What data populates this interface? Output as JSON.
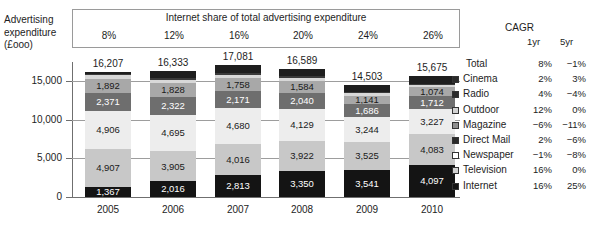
{
  "axis_title": [
    "Advertising",
    "expenditure",
    "(£ooo)"
  ],
  "share_header": {
    "title": "Internet share of total advertising expenditure",
    "values": [
      "8%",
      "12%",
      "16%",
      "20%",
      "24%",
      "26%"
    ]
  },
  "cagr": {
    "title": "CAGR",
    "col1": "1yr",
    "col2": "5yr"
  },
  "legend": [
    {
      "name": "Total",
      "marker": "none",
      "cagr_1yr": "8%",
      "cagr_5yr": "−1%"
    },
    {
      "name": "Cinema",
      "marker": "dark",
      "cagr_1yr": "2%",
      "cagr_5yr": "3%"
    },
    {
      "name": "Radio",
      "marker": "dark",
      "cagr_1yr": "4%",
      "cagr_5yr": "−4%"
    },
    {
      "name": "Outdoor",
      "marker": "light",
      "cagr_1yr": "12%",
      "cagr_5yr": "0%"
    },
    {
      "name": "Magazine",
      "marker": "mid",
      "cagr_1yr": "−6%",
      "cagr_5yr": "−11%"
    },
    {
      "name": "Direct Mail",
      "marker": "dark",
      "cagr_1yr": "2%",
      "cagr_5yr": "−6%"
    },
    {
      "name": "Newspaper",
      "marker": "white",
      "cagr_1yr": "−1%",
      "cagr_5yr": "−8%"
    },
    {
      "name": "Television",
      "marker": "light",
      "cagr_1yr": "16%",
      "cagr_5yr": "0%"
    },
    {
      "name": "Internet",
      "marker": "black",
      "cagr_1yr": "16%",
      "cagr_5yr": "25%"
    }
  ],
  "chart_data": {
    "type": "bar",
    "stacked": true,
    "title": "",
    "xlabel": "",
    "ylabel": "Advertising expenditure (£ooo)",
    "ylim": [
      0,
      17500
    ],
    "yticks": [
      "0",
      "5,000",
      "10,000",
      "15,000"
    ],
    "ytick_values": [
      0,
      5000,
      10000,
      15000
    ],
    "grid": true,
    "legend_position": "right",
    "categories": [
      "2005",
      "2006",
      "2007",
      "2008",
      "2009",
      "2010"
    ],
    "totals": [
      "16,207",
      "16,333",
      "17,081",
      "16,589",
      "14,503",
      "15,675"
    ],
    "total_values": [
      16207,
      16333,
      17081,
      16589,
      14503,
      15675
    ],
    "series": [
      {
        "name": "Internet",
        "color": "#141414",
        "text": "#ffffff",
        "values": [
          1367,
          2016,
          2813,
          3350,
          3541,
          4097
        ],
        "labels": [
          "1,367",
          "2,016",
          "2,813",
          "3,350",
          "3,541",
          "4,097"
        ]
      },
      {
        "name": "Television",
        "color": "#c8c8c8",
        "text": "#1a1a1a",
        "values": [
          4907,
          3905,
          4016,
          3922,
          3525,
          4083
        ],
        "labels": [
          "4,907",
          "3,905",
          "4,016",
          "3,922",
          "3,525",
          "4,083"
        ]
      },
      {
        "name": "Newspaper",
        "color": "#ededed",
        "text": "#1a1a1a",
        "values": [
          4906,
          4695,
          4680,
          4129,
          3244,
          3227
        ],
        "labels": [
          "4,906",
          "4,695",
          "4,680",
          "4,129",
          "3,244",
          "3,227"
        ]
      },
      {
        "name": "Direct Mail",
        "color": "#6e6e6e",
        "text": "#ffffff",
        "values": [
          2371,
          2322,
          2171,
          2040,
          1686,
          1712
        ],
        "labels": [
          "2,371",
          "2,322",
          "2,171",
          "2,040",
          "1,686",
          "1,712"
        ]
      },
      {
        "name": "Magazine",
        "color": "#a8a8a8",
        "text": "#1a1a1a",
        "values": [
          1892,
          1828,
          1758,
          1584,
          1141,
          1074
        ],
        "labels": [
          "1,892",
          "1,828",
          "1,758",
          "1,584",
          "1,141",
          "1,074"
        ]
      },
      {
        "name": "Outdoor",
        "color": "#d8d8d8",
        "text": "#1a1a1a",
        "values": [
          430,
          420,
          420,
          420,
          300,
          320
        ],
        "labels": [
          "",
          "",
          "",
          "",
          "",
          ""
        ]
      },
      {
        "name": "Radio",
        "color": "#3a3a3a",
        "text": "#ffffff",
        "values": [
          220,
          220,
          230,
          200,
          180,
          180
        ],
        "labels": [
          "",
          "",
          "",
          "",
          "",
          ""
        ]
      },
      {
        "name": "Cinema",
        "color": "#1e1e1e",
        "text": "#ffffff",
        "values": [
          214,
          927,
          993,
          944,
          886,
          982
        ],
        "labels": [
          "",
          "",
          "",
          "",
          "",
          ""
        ]
      }
    ]
  }
}
